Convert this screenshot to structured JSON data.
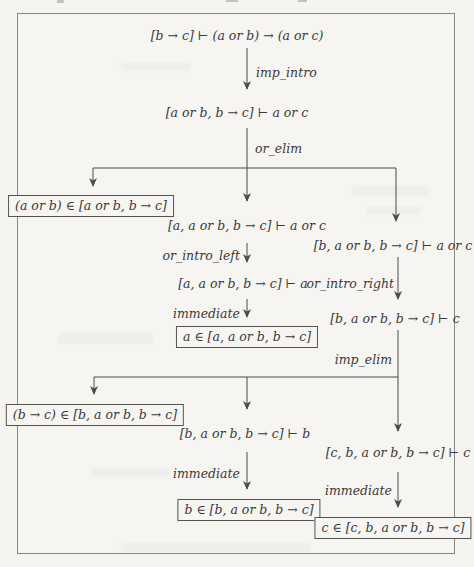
{
  "page": {
    "background_color": "#f5f4f0",
    "ink_color": "#3a3a3a",
    "line_color": "#4b4b47",
    "frame_border_color": "#878783"
  },
  "diagram": {
    "type": "proof-derivation-tree",
    "nodes": {
      "root": "[b → c] ⊢ (a or b) → (a or c)",
      "after_imp_intro": "[a or b, b → c] ⊢ a or c",
      "aorb_membership": "(a or b) ∈ [a or b, b → c]",
      "case_a_goal": "[a, a or b, b → c] ⊢ a or c",
      "case_b_goal": "[b, a or b, b → c] ⊢ a or c",
      "case_a_sub": "[a, a or b, b → c] ⊢ a",
      "a_membership": "a ∈ [a, a or b, b → c]",
      "case_b_c": "[b, a or b, b → c] ⊢ c",
      "btoc_membership": "(b → c) ∈ [b, a or b, b → c]",
      "b_goal": "[b, a or b, b → c] ⊢ b",
      "c_goal": "[c, b, a or b, b → c] ⊢ c",
      "b_membership": "b ∈ [b, a or b, b → c]",
      "c_membership": "c ∈ [c, b, a or b, b → c]"
    },
    "edge_labels": {
      "imp_intro": "imp_intro",
      "or_elim": "or_elim",
      "or_intro_left": "or_intro_left",
      "or_intro_right": "or_intro_right",
      "immediate_1": "immediate",
      "imp_elim": "imp_elim",
      "immediate_2": "immediate",
      "immediate_3": "immediate"
    }
  }
}
